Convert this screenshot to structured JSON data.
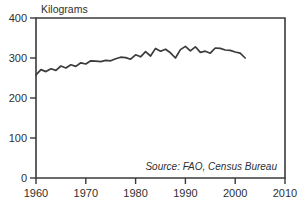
{
  "chart_data": {
    "type": "line",
    "title": "Kilograms",
    "xlabel": "",
    "ylabel": "Kilograms",
    "xlim": [
      1960,
      2010
    ],
    "ylim": [
      0,
      400
    ],
    "grid": false,
    "legend_position": "none",
    "annotation": "Source: FAO, Census Bureau",
    "xticks": [
      "1960",
      "1970",
      "1980",
      "1990",
      "2000",
      "2010"
    ],
    "xtick_values": [
      1960,
      1970,
      1980,
      1990,
      2000,
      2010
    ],
    "yticks": [
      "0",
      "100",
      "200",
      "300",
      "400"
    ],
    "ytick_values": [
      0,
      100,
      200,
      300,
      400
    ],
    "series": [
      {
        "name": "Grain production per person",
        "x": [
          1960,
          1961,
          1962,
          1963,
          1964,
          1965,
          1966,
          1967,
          1968,
          1969,
          1970,
          1971,
          1972,
          1973,
          1974,
          1975,
          1976,
          1977,
          1978,
          1979,
          1980,
          1981,
          1982,
          1983,
          1984,
          1985,
          1986,
          1987,
          1988,
          1989,
          1990,
          1991,
          1992,
          1993,
          1994,
          1995,
          1996,
          1997,
          1998,
          1999,
          2000,
          2001,
          2002
        ],
        "values": [
          258,
          271,
          266,
          273,
          269,
          280,
          275,
          283,
          279,
          288,
          285,
          293,
          292,
          291,
          294,
          293,
          298,
          302,
          301,
          297,
          308,
          303,
          316,
          305,
          324,
          317,
          322,
          313,
          300,
          321,
          329,
          318,
          328,
          314,
          317,
          312,
          325,
          324,
          320,
          319,
          315,
          312,
          300
        ]
      }
    ]
  },
  "axes": {
    "y_unit_label": "Kilograms"
  }
}
